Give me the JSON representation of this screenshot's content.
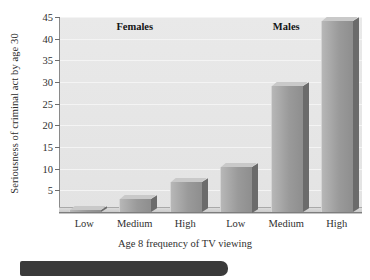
{
  "chart_data": {
    "type": "bar",
    "title": "",
    "xlabel": "Age 8 frequency of TV viewing",
    "ylabel": "Seriousness of criminal act by age 30",
    "ylim": [
      0,
      45
    ],
    "grid": true,
    "legend_position": "none",
    "yticks": [
      45,
      40,
      35,
      30,
      25,
      20,
      15,
      10,
      5
    ],
    "categories": [
      "Low",
      "Medium",
      "High",
      "Low",
      "Medium",
      "High"
    ],
    "groups": [
      {
        "name": "Females",
        "categories": [
          "Low",
          "Medium",
          "High"
        ],
        "values": [
          0.5,
          3,
          7
        ]
      },
      {
        "name": "Males",
        "categories": [
          "Low",
          "Medium",
          "High"
        ],
        "values": [
          10.5,
          29,
          44
        ]
      }
    ],
    "values": [
      0.5,
      3,
      7,
      10.5,
      29,
      44
    ],
    "bar_color": "#9a9a9a",
    "plot_background": "#e6e6e6",
    "gridline_color": "#f4f4f4"
  },
  "annotations": {
    "group_labels": [
      "Females",
      "Males"
    ],
    "caption_bar_color": "#3a3a3a"
  }
}
